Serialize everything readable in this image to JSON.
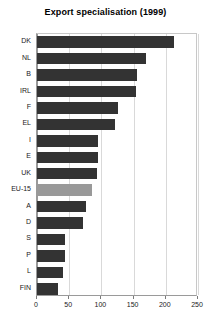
{
  "chart_data": {
    "type": "bar",
    "orientation": "horizontal",
    "title": "Export specialisation (1999)",
    "xlabel": "",
    "ylabel": "",
    "categories": [
      "DK",
      "NL",
      "B",
      "IRL",
      "F",
      "EL",
      "I",
      "E",
      "UK",
      "EU-15",
      "A",
      "D",
      "S",
      "P",
      "L",
      "FIN"
    ],
    "values": [
      212,
      169,
      155,
      153,
      126,
      121,
      95,
      95,
      93,
      85,
      76,
      72,
      44,
      43,
      41,
      32
    ],
    "xlim": [
      0,
      250
    ],
    "xticks": [
      0,
      50,
      100,
      150,
      200,
      250
    ],
    "xticklabels": [
      "0",
      "50",
      "100",
      "150",
      "200",
      "250"
    ],
    "grid": true,
    "legend": false,
    "bar_color": "#333333",
    "highlight_category": "EU-15",
    "highlight_color": "#999999",
    "background_color": "#ffffff",
    "gridline_color": "#d9d9d9",
    "axis_color": "#9a9a9a"
  }
}
